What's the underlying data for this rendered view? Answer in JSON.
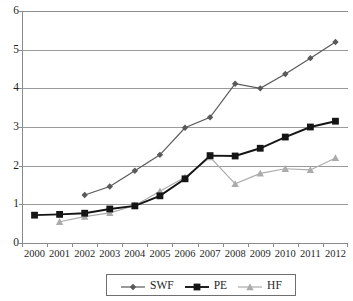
{
  "chart_data": {
    "type": "line",
    "title": "",
    "xlabel": "",
    "ylabel": "",
    "categories": [
      "2000",
      "2001",
      "2002",
      "2003",
      "2004",
      "2005",
      "2006",
      "2007",
      "2008",
      "2009",
      "2010",
      "2011",
      "2012"
    ],
    "ylim": [
      0,
      6
    ],
    "y_ticks": [
      0,
      1,
      2,
      3,
      4,
      5,
      6
    ],
    "grid": true,
    "legend_position": "bottom-center",
    "series": [
      {
        "name": "SWF",
        "marker": "diamond",
        "color": "#595959",
        "values": [
          null,
          null,
          1.24,
          1.46,
          1.87,
          2.28,
          2.98,
          3.25,
          4.12,
          4.0,
          4.37,
          4.78,
          5.2
        ]
      },
      {
        "name": "PE",
        "marker": "square",
        "color": "#151515",
        "values": [
          0.72,
          0.74,
          0.77,
          0.88,
          0.96,
          1.22,
          1.66,
          2.26,
          2.25,
          2.45,
          2.74,
          3.0,
          3.15
        ]
      },
      {
        "name": "HF",
        "marker": "triangle",
        "color": "#ababab",
        "values": [
          null,
          0.55,
          0.68,
          0.78,
          0.97,
          1.34,
          1.7,
          2.22,
          1.53,
          1.8,
          1.92,
          1.89,
          2.2
        ]
      }
    ]
  },
  "legend": {
    "entries": [
      {
        "label": "SWF"
      },
      {
        "label": "PE"
      },
      {
        "label": "HF"
      }
    ]
  }
}
